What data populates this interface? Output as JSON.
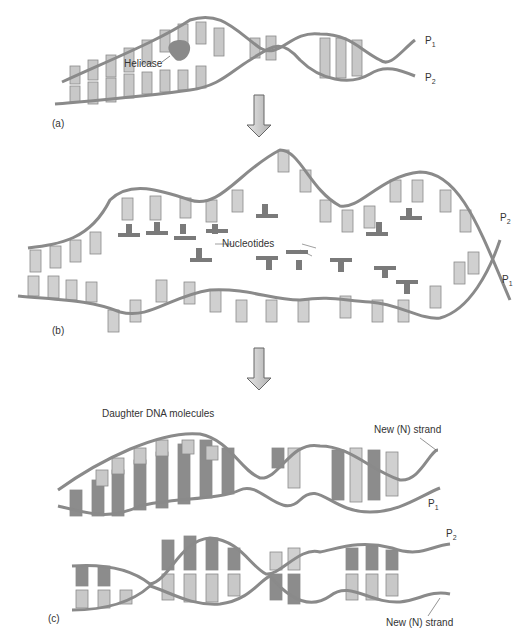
{
  "figure": {
    "panels": [
      {
        "id": "a",
        "label": "(a)",
        "annotations": [
          "Helicase",
          "P1",
          "P2"
        ]
      },
      {
        "id": "b",
        "label": "(b)",
        "annotations": [
          "Nucleotides",
          "P2",
          "P1"
        ]
      },
      {
        "id": "c",
        "label": "(c)",
        "title": "Daughter DNA molecules",
        "annotations": [
          "New (N) strand",
          "P1",
          "P2",
          "New (N) strand"
        ]
      }
    ],
    "labels": {
      "a_label": "(a)",
      "b_label": "(b)",
      "c_label": "(c)",
      "helicase": "Helicase",
      "nucleotides": "Nucleotides",
      "daughter": "Daughter DNA molecules",
      "new_strand_top": "New (N) strand",
      "new_strand_bottom": "New (N) strand",
      "p": "P",
      "sub1": "1",
      "sub2": "2"
    },
    "colors": {
      "backbone": "#8a8a8a",
      "base_light": "#d4d4d4",
      "base_mid": "#b8b8b8",
      "base_dark": "#8c8c8c",
      "arrow": "#cfcfcf",
      "helicase": "#8a8a8a"
    }
  }
}
